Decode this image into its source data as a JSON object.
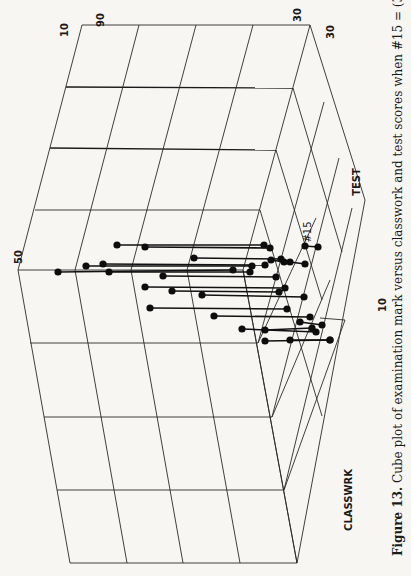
{
  "figure": {
    "number_label": "Figure 13.",
    "caption_text": " Cube plot of examination mark versus classwork and test scores when #15 = (33, 20, 20).",
    "rotation_deg": -90
  },
  "axes": {
    "exam_tick_50": "50",
    "exam_tick_90": "90",
    "classwrk_tick_10": "10",
    "classwrk_tick_30": "30",
    "test_tick_30": "30",
    "test_tick_10": "10",
    "test_label": "TEST",
    "classwrk_label": "CLASSWRK",
    "highlight_point_label": "#15"
  },
  "colors": {
    "background": "#f7f6f3",
    "ink": "#111111"
  },
  "chart_data": {
    "type": "scatter",
    "title": "Cube plot of examination mark versus classwork and test scores when #15 = (33, 20, 20)",
    "xlabel": "CLASSWRK",
    "ylabel": "TEST",
    "zlabel": "Examination mark",
    "axis_ticks": {
      "exam": [
        "50",
        "90"
      ],
      "classwrk": [
        "10",
        "30"
      ],
      "test": [
        "10",
        "30"
      ]
    },
    "grid": true,
    "annotations": [
      "#15"
    ],
    "highlighted_point": {
      "label": "#15",
      "exam": 33,
      "classwrk": 20,
      "test": 20
    },
    "points_screen": [
      {
        "top": [
          117,
          245
        ],
        "base": [
          264,
          245
        ]
      },
      {
        "top": [
          145,
          247
        ],
        "base": [
          270,
          248
        ]
      },
      {
        "top": [
          194,
          258
        ],
        "base": [
          281,
          259
        ]
      },
      {
        "top": [
          86,
          266
        ],
        "base": [
          252,
          266
        ]
      },
      {
        "top": [
          103,
          264
        ],
        "base": [
          265,
          265
        ]
      },
      {
        "top": [
          58,
          272
        ],
        "base": [
          233,
          270
        ]
      },
      {
        "top": [
          109,
          272
        ],
        "base": [
          250,
          272
        ]
      },
      {
        "top": [
          163,
          276
        ],
        "base": [
          276,
          277
        ]
      },
      {
        "top": [
          145,
          287
        ],
        "base": [
          285,
          288
        ]
      },
      {
        "top": [
          172,
          291
        ],
        "base": [
          279,
          292
        ]
      },
      {
        "top": [
          202,
          295
        ],
        "base": [
          304,
          297
        ]
      },
      {
        "top": [
          150,
          308
        ],
        "base": [
          287,
          309
        ]
      },
      {
        "top": [
          214,
          316
        ],
        "base": [
          310,
          317
        ]
      },
      {
        "top": [
          242,
          329
        ],
        "base": [
          316,
          332
        ]
      },
      {
        "top": [
          265,
          341
        ],
        "base": [
          330,
          340
        ]
      },
      {
        "top": [
          290,
          340
        ],
        "base": [
          330,
          340
        ]
      },
      {
        "top": [
          305,
          246
        ],
        "base": [
          318,
          247
        ]
      },
      {
        "top": [
          290,
          262
        ],
        "base": [
          305,
          264
        ]
      },
      {
        "top": [
          271,
          260
        ],
        "base": [
          284,
          262
        ]
      },
      {
        "top": [
          300,
          322
        ],
        "base": [
          322,
          325
        ]
      },
      {
        "top": [
          265,
          330
        ],
        "base": [
          312,
          328
        ]
      }
    ]
  }
}
